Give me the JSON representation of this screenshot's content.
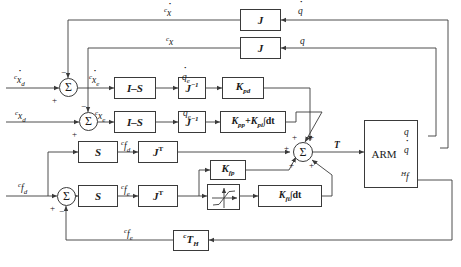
{
  "diagram": {
    "width": 461,
    "height": 267,
    "line_color": "#3a3a3a",
    "background": "#ffffff"
  },
  "blocks": {
    "jacobian_vel": "J",
    "jacobian_pos": "J",
    "select_vel": "I–S",
    "select_pos": "I–S",
    "jinv_vel": "J",
    "jinv_pos": "J",
    "kpd": "K",
    "kpd_sub": "pd",
    "kpp_kpi": "K",
    "kpp_sub": "pp",
    "kpi_plus": "+K",
    "kpi_sub": "pi",
    "kpi_int": "∫dt",
    "sel_force_d": "S",
    "sel_force_e": "S",
    "jt_force_d": "J",
    "jt_force_e": "J",
    "kfp": "K",
    "kfp_sub": "fp",
    "saturation": "saturation-nonlinearity",
    "kfi": "K",
    "kfi_sub": "fi",
    "kfi_int": "∫dt",
    "arm": "ARM",
    "th": "T",
    "th_sub": "H",
    "th_pre": "c"
  },
  "signals": {
    "cmd_vel": "x",
    "cmd_pos": "x",
    "cmd_vel_sub": "d",
    "cmd_pos_sub": "d",
    "cmd_force": "f",
    "cmd_force_sub": "d",
    "err_vel": "x",
    "err_vel_sub": "e",
    "err_pos": "x",
    "err_pos_sub": "e",
    "err_force": "f",
    "err_force_sub": "e",
    "joint_vel_err": "q",
    "joint_vel_err_sub": "e",
    "joint_pos_err": "q",
    "joint_pos_err_sub": "e",
    "cart_vel_fb": "x",
    "cart_pos_fb": "x",
    "joint_vel_fb": "q",
    "joint_pos_fb": "q",
    "desired_force": "f",
    "desired_force_sub": "d",
    "sensed_force": "f",
    "sensed_force_sub": "e",
    "torque": "T",
    "arm_out_pos": "q",
    "arm_out_vel": "q",
    "arm_out_force": "f",
    "arm_out_force_pre": "H",
    "prefix_c": "c"
  },
  "summers": {
    "symbol": "Σ",
    "vel_plus": "+",
    "vel_minus": "−",
    "pos_plus": "+",
    "pos_minus": "−",
    "force_plus": "+",
    "force_minus": "−",
    "torque_signs": [
      "+",
      "+",
      "+",
      "+",
      "+"
    ]
  }
}
